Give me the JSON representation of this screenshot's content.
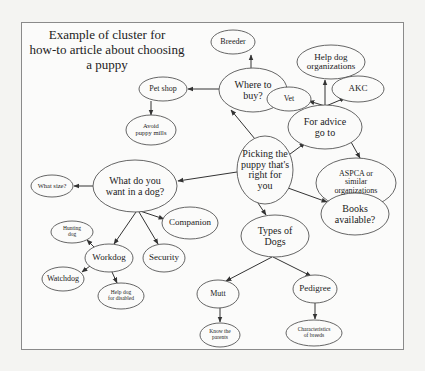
{
  "title": {
    "lines": [
      "Example of cluster for",
      "how-to article about choosing",
      "a puppy"
    ]
  },
  "nodes": [
    {
      "id": "picking",
      "lines": [
        "Picking the",
        "puppy that's",
        "right for",
        "you"
      ],
      "cx": 265,
      "cy": 170,
      "rx": 28,
      "ry": 34,
      "fs": 10
    },
    {
      "id": "where-to-buy",
      "lines": [
        "Where to",
        "buy?"
      ],
      "cx": 253,
      "cy": 90,
      "rx": 34,
      "ry": 22,
      "fs": 10
    },
    {
      "id": "breeder",
      "lines": [
        "Breeder"
      ],
      "cx": 233,
      "cy": 42,
      "rx": 22,
      "ry": 12,
      "fs": 8
    },
    {
      "id": "pet-shop",
      "lines": [
        "Pet shop"
      ],
      "cx": 163,
      "cy": 89,
      "rx": 24,
      "ry": 12,
      "fs": 8
    },
    {
      "id": "avoid-puppy-mills",
      "lines": [
        "Avoid",
        "puppy mills"
      ],
      "cx": 151,
      "cy": 130,
      "rx": 25,
      "ry": 15,
      "fs": 6.5
    },
    {
      "id": "for-advice",
      "lines": [
        "For advice",
        "go to"
      ],
      "cx": 325,
      "cy": 127,
      "rx": 37,
      "ry": 22,
      "fs": 10
    },
    {
      "id": "help-dog-orgs",
      "lines": [
        "Help dog",
        "organizations"
      ],
      "cx": 331,
      "cy": 62,
      "rx": 34,
      "ry": 17,
      "fs": 9
    },
    {
      "id": "vet",
      "lines": [
        "Vet"
      ],
      "cx": 289,
      "cy": 99,
      "rx": 22,
      "ry": 12,
      "fs": 8
    },
    {
      "id": "akc",
      "lines": [
        "AKC"
      ],
      "cx": 358,
      "cy": 89,
      "rx": 26,
      "ry": 13,
      "fs": 9
    },
    {
      "id": "aspca",
      "lines": [
        "ASPCA or",
        "similar",
        "organizations"
      ],
      "cx": 356,
      "cy": 183,
      "rx": 40,
      "ry": 25,
      "fs": 8
    },
    {
      "id": "books",
      "lines": [
        "Books",
        "available?"
      ],
      "cx": 355,
      "cy": 214,
      "rx": 34,
      "ry": 21,
      "fs": 10
    },
    {
      "id": "what-want",
      "lines": [
        "What do you",
        "want in a dog?"
      ],
      "cx": 135,
      "cy": 186,
      "rx": 42,
      "ry": 26,
      "fs": 10
    },
    {
      "id": "what-size",
      "lines": [
        "What size?"
      ],
      "cx": 52,
      "cy": 186,
      "rx": 21,
      "ry": 11,
      "fs": 6.5
    },
    {
      "id": "companion",
      "lines": [
        "Companion"
      ],
      "cx": 190,
      "cy": 223,
      "rx": 28,
      "ry": 16,
      "fs": 9
    },
    {
      "id": "security",
      "lines": [
        "Security"
      ],
      "cx": 164,
      "cy": 258,
      "rx": 21,
      "ry": 14,
      "fs": 9
    },
    {
      "id": "workdog",
      "lines": [
        "Workdog"
      ],
      "cx": 109,
      "cy": 258,
      "rx": 24,
      "ry": 14,
      "fs": 9
    },
    {
      "id": "hunting-dog",
      "lines": [
        "Hunting",
        "dog"
      ],
      "cx": 72,
      "cy": 232,
      "rx": 21,
      "ry": 11,
      "fs": 5.5
    },
    {
      "id": "watchdog",
      "lines": [
        "Watchdog"
      ],
      "cx": 63,
      "cy": 279,
      "rx": 21,
      "ry": 12,
      "fs": 8
    },
    {
      "id": "help-dog-disabled",
      "lines": [
        "Help dog",
        "for disabled"
      ],
      "cx": 121,
      "cy": 296,
      "rx": 23,
      "ry": 13,
      "fs": 5.5
    },
    {
      "id": "types-of-dogs",
      "lines": [
        "Types of",
        "Dogs"
      ],
      "cx": 275,
      "cy": 236,
      "rx": 34,
      "ry": 21,
      "fs": 10
    },
    {
      "id": "mutt",
      "lines": [
        "Mutt"
      ],
      "cx": 218,
      "cy": 294,
      "rx": 21,
      "ry": 14,
      "fs": 8
    },
    {
      "id": "know-parents",
      "lines": [
        "Know the",
        "parents"
      ],
      "cx": 220,
      "cy": 335,
      "rx": 20,
      "ry": 12,
      "fs": 5.5
    },
    {
      "id": "pedigree",
      "lines": [
        "Pedigree"
      ],
      "cx": 315,
      "cy": 289,
      "rx": 22,
      "ry": 14,
      "fs": 9
    },
    {
      "id": "characteristics",
      "lines": [
        "Characteristics",
        "of breeds"
      ],
      "cx": 314,
      "cy": 333,
      "rx": 28,
      "ry": 13,
      "fs": 5.5
    }
  ],
  "edges": [
    {
      "from": "picking",
      "to": "where-to-buy",
      "x1": 255,
      "y1": 139,
      "x2": 231,
      "y2": 110
    },
    {
      "from": "where-to-buy",
      "to": "breeder",
      "x1": 251,
      "y1": 68,
      "x2": 251,
      "y2": 55
    },
    {
      "from": "where-to-buy",
      "to": "pet-shop",
      "x1": 219,
      "y1": 89,
      "x2": 188,
      "y2": 89
    },
    {
      "from": "pet-shop",
      "to": "avoid-puppy-mills",
      "x1": 151,
      "y1": 101,
      "x2": 151,
      "y2": 115
    },
    {
      "from": "picking",
      "to": "for-advice",
      "x1": 286,
      "y1": 157,
      "x2": 305,
      "y2": 143
    },
    {
      "from": "for-advice",
      "to": "help-dog-orgs",
      "x1": 325,
      "y1": 105,
      "x2": 325,
      "y2": 80
    },
    {
      "from": "for-advice",
      "to": "vet",
      "x1": 325,
      "y1": 106,
      "x2": 309,
      "y2": 101
    },
    {
      "from": "for-advice",
      "to": "akc",
      "x1": 326,
      "y1": 106,
      "x2": 345,
      "y2": 98
    },
    {
      "from": "for-advice",
      "to": "aspca",
      "x1": 351,
      "y1": 142,
      "x2": 360,
      "y2": 158
    },
    {
      "from": "picking",
      "to": "books",
      "x1": 288,
      "y1": 188,
      "x2": 327,
      "y2": 202
    },
    {
      "from": "picking",
      "to": "what-want",
      "x1": 237,
      "y1": 172,
      "x2": 178,
      "y2": 181
    },
    {
      "from": "what-want",
      "to": "what-size",
      "x1": 93,
      "y1": 186,
      "x2": 74,
      "y2": 186
    },
    {
      "from": "what-want",
      "to": "companion",
      "x1": 140,
      "y1": 211,
      "x2": 164,
      "y2": 219
    },
    {
      "from": "what-want",
      "to": "security",
      "x1": 139,
      "y1": 212,
      "x2": 158,
      "y2": 244
    },
    {
      "from": "what-want",
      "to": "workdog",
      "x1": 136,
      "y1": 212,
      "x2": 114,
      "y2": 244
    },
    {
      "from": "workdog",
      "to": "hunting-dog",
      "x1": 95,
      "y1": 248,
      "x2": 87,
      "y2": 240
    },
    {
      "from": "workdog",
      "to": "watchdog",
      "x1": 90,
      "y1": 266,
      "x2": 82,
      "y2": 272
    },
    {
      "from": "workdog",
      "to": "help-dog-disabled",
      "x1": 112,
      "y1": 272,
      "x2": 117,
      "y2": 283
    },
    {
      "from": "picking",
      "to": "types-of-dogs",
      "x1": 258,
      "y1": 203,
      "x2": 266,
      "y2": 215
    },
    {
      "from": "types-of-dogs",
      "to": "mutt",
      "x1": 272,
      "y1": 257,
      "x2": 226,
      "y2": 281
    },
    {
      "from": "types-of-dogs",
      "to": "pedigree",
      "x1": 273,
      "y1": 257,
      "x2": 311,
      "y2": 276
    },
    {
      "from": "mutt",
      "to": "know-parents",
      "x1": 220,
      "y1": 308,
      "x2": 220,
      "y2": 322
    },
    {
      "from": "pedigree",
      "to": "characteristics",
      "x1": 315,
      "y1": 303,
      "x2": 315,
      "y2": 319
    }
  ],
  "colors": {
    "stroke": "#555555",
    "edge": "#333333",
    "text": "#222222",
    "frame": "#8a8a8a",
    "background": "#fbfbfa"
  }
}
